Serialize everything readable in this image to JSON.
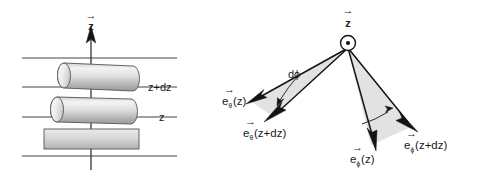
{
  "figure": {
    "background_color": "#ffffff",
    "line_color": "#141414",
    "wedge_fill": "#e2e2e2",
    "cylinder_fill_light": "#f2f2f2",
    "cylinder_fill_dark": "#9e9e9e"
  },
  "left_panel": {
    "name": "cylinders-stack-diagram",
    "axis": {
      "label": "z",
      "vector_marker": "→",
      "direction": "up",
      "icon": "up-arrow-icon"
    },
    "level_labels": [
      {
        "text": "z+dz",
        "id": "level-z-plus-dz"
      },
      {
        "text": "z",
        "id": "level-z"
      }
    ],
    "horizontal_lines": 4,
    "shapes": [
      {
        "id": "cylinder-top",
        "type": "cylinder-3d"
      },
      {
        "id": "cylinder-middle",
        "type": "cylinder-3d"
      },
      {
        "id": "cylinder-bottom",
        "type": "rectangle-flat"
      }
    ]
  },
  "right_panel": {
    "name": "unit-vector-rotation-diagram",
    "origin": {
      "icon": "dot-in-circle-icon",
      "meaning": "z-axis out of page"
    },
    "axis": {
      "label": "z",
      "vector_marker": "→"
    },
    "angle_label": "dϕ",
    "vectors": [
      {
        "id": "e-theta-z",
        "base": "e",
        "subscript": "θ",
        "argument": "(z)",
        "vector_marker": "→",
        "side": "left"
      },
      {
        "id": "e-theta-z-plus-dz",
        "base": "e",
        "subscript": "θ",
        "argument": "(z+dz)",
        "vector_marker": "→",
        "side": "left"
      },
      {
        "id": "e-phi-z",
        "base": "e",
        "subscript": "ϕ",
        "argument": "(z)",
        "vector_marker": "→",
        "side": "right"
      },
      {
        "id": "e-phi-z-plus-dz",
        "base": "e",
        "subscript": "ϕ",
        "argument": "(z+dz)",
        "vector_marker": "→",
        "side": "right"
      }
    ]
  }
}
